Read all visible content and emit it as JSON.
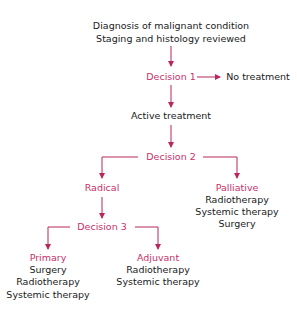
{
  "colors": {
    "accent": "#c9306a",
    "text": "#1a1a1a",
    "background": "#ffffff"
  },
  "root": {
    "line1": "Diagnosis of malignant condition",
    "line2": "Staging and histology reviewed"
  },
  "decision1": {
    "label": "Decision 1",
    "no_branch": "No treatment"
  },
  "active": {
    "label": "Active treatment"
  },
  "decision2": {
    "label": "Decision 2"
  },
  "radical": {
    "label": "Radical"
  },
  "palliative": {
    "label": "Palliative",
    "items": [
      "Radiotherapy",
      "Systemic therapy",
      "Surgery"
    ]
  },
  "decision3": {
    "label": "Decision 3"
  },
  "primary": {
    "label": "Primary",
    "items": [
      "Surgery",
      "Radiotherapy",
      "Systemic therapy"
    ]
  },
  "adjuvant": {
    "label": "Adjuvant",
    "items": [
      "Radiotherapy",
      "Systemic therapy"
    ]
  }
}
